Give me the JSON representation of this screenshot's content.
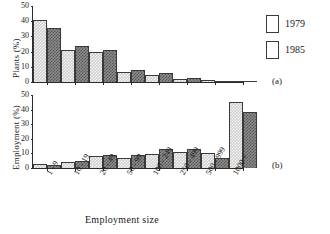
{
  "legend": {
    "position": "right-top",
    "entries": [
      {
        "label": "1979",
        "key": "s1979",
        "color": "#cfcfcf"
      },
      {
        "label": "1985",
        "key": "s1985",
        "color": "#8e8e8e"
      }
    ]
  },
  "panel_tags": {
    "top": "(a)",
    "bottom": "(b)"
  },
  "xaxis_title": "Employment size",
  "chart_data": [
    {
      "type": "bar",
      "title": "",
      "panel": "(a)",
      "xlabel": "Employment size",
      "ylabel": "Plants (%)",
      "ylim": [
        0,
        50
      ],
      "yticks": [
        0,
        10,
        20,
        30,
        40,
        50
      ],
      "grid": false,
      "legend_position": "right-top",
      "categories": [
        "1 - 9",
        "10 - 19",
        "20 - 49",
        "50 - 99",
        "100 - 249",
        "250 - 499",
        "500 - 999",
        "1000 +"
      ],
      "series": [
        {
          "name": "1979",
          "values": [
            41.0,
            21.0,
            19.5,
            6.8,
            4.5,
            2.0,
            1.0,
            0.6
          ]
        },
        {
          "name": "1985",
          "values": [
            35.5,
            23.5,
            21.0,
            8.2,
            5.8,
            2.4,
            0.7,
            0.6
          ]
        }
      ]
    },
    {
      "type": "bar",
      "title": "",
      "panel": "(b)",
      "xlabel": "Employment size",
      "ylabel": "Employment (%)",
      "ylim": [
        0,
        50
      ],
      "yticks": [
        0,
        10,
        20,
        30,
        40,
        50
      ],
      "grid": false,
      "legend_position": "right-top",
      "categories": [
        "1 - 9",
        "10 - 19",
        "20 - 49",
        "50 - 99",
        "100 - 249",
        "250 - 499",
        "500 - 999",
        "1000 +"
      ],
      "series": [
        {
          "name": "1979",
          "values": [
            2.6,
            4.0,
            8.2,
            6.8,
            9.6,
            11.0,
            10.0,
            45.0
          ]
        },
        {
          "name": "1985",
          "values": [
            2.3,
            4.6,
            9.0,
            8.6,
            13.0,
            12.9,
            7.2,
            38.5
          ]
        }
      ]
    }
  ]
}
